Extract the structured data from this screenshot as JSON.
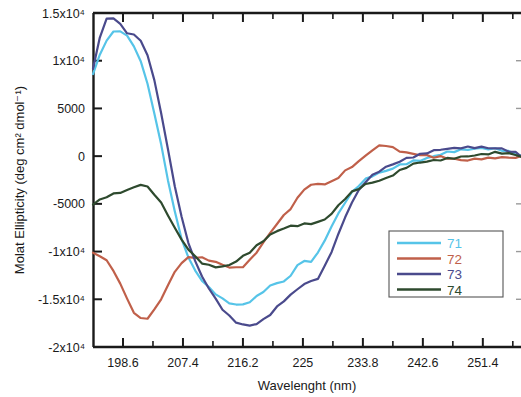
{
  "chart_data": {
    "type": "line",
    "title": "",
    "xlabel": "Wavelenght (nm)",
    "ylabel": "Molat Ellipticity (deg cm² dmol⁻¹)",
    "xlim": [
      194.2,
      257.0
    ],
    "ylim": [
      -20000,
      15000
    ],
    "grid": false,
    "legend_position": "bottom-right",
    "xticks": [
      198.6,
      207.4,
      216.2,
      225,
      233.8,
      242.6,
      251.4
    ],
    "xtick_labels": [
      "198.6",
      "207.4",
      "216.2",
      "225",
      "233.8",
      "242.6",
      "251.4"
    ],
    "yticks": [
      15000,
      10000,
      5000,
      0,
      -5000,
      -10000,
      -15000,
      -20000
    ],
    "ytick_labels": [
      "1.5x10⁴",
      "1x10⁴",
      "5000",
      "0",
      "-5000",
      "-1x10⁴",
      "-1.5x10⁴",
      "-2x10⁴"
    ],
    "x": [
      194.2,
      195.2,
      196.2,
      197.2,
      198.2,
      199.2,
      200.2,
      201.2,
      202.2,
      203.2,
      204.2,
      205.2,
      206.2,
      207.2,
      208.2,
      209.2,
      210.2,
      211.2,
      212.2,
      213.2,
      214.2,
      215.2,
      216.2,
      217.2,
      218.2,
      219.2,
      220.2,
      221.2,
      222.2,
      223.2,
      224.2,
      225.2,
      226.2,
      227.2,
      228.2,
      229.2,
      230.2,
      231.2,
      232.2,
      233.2,
      234.2,
      235.2,
      236.2,
      237.2,
      238.2,
      239.2,
      240.2,
      241.2,
      242.2,
      243.2,
      244.2,
      245.2,
      246.2,
      247.2,
      248.2,
      249.2,
      250.2,
      251.2,
      252.2,
      253.2,
      254.2,
      255.2,
      256.2,
      257.0
    ],
    "series": [
      {
        "name": "71",
        "color": "#56C4E8",
        "values": [
          8600,
          10600,
          12200,
          13000,
          13200,
          12600,
          11600,
          10000,
          7600,
          4600,
          1200,
          -2400,
          -5800,
          -8600,
          -10600,
          -12000,
          -13000,
          -13800,
          -14400,
          -15000,
          -15400,
          -15600,
          -15600,
          -15300,
          -14800,
          -14200,
          -13700,
          -13300,
          -13200,
          -12600,
          -11400,
          -11100,
          -11000,
          -10200,
          -8800,
          -7400,
          -6000,
          -4800,
          -3800,
          -3000,
          -2400,
          -2000,
          -1700,
          -1500,
          -1200,
          -900,
          -700,
          -500,
          -400,
          -200,
          0,
          200,
          400,
          500,
          600,
          700,
          700,
          800,
          700,
          700,
          600,
          400,
          200,
          0
        ]
      },
      {
        "name": "72",
        "color": "#C0604A",
        "values": [
          -10200,
          -10400,
          -11000,
          -12000,
          -13400,
          -15000,
          -16400,
          -17100,
          -17000,
          -16200,
          -15000,
          -13600,
          -12200,
          -11200,
          -10700,
          -10600,
          -10700,
          -10900,
          -11100,
          -11400,
          -11600,
          -11700,
          -11500,
          -10900,
          -10000,
          -9000,
          -8000,
          -7000,
          -6200,
          -5400,
          -4400,
          -3400,
          -3000,
          -2900,
          -2900,
          -2700,
          -2200,
          -1600,
          -1100,
          -600,
          0,
          600,
          1000,
          1100,
          800,
          500,
          300,
          200,
          100,
          0,
          -100,
          -100,
          -200,
          -300,
          -400,
          -400,
          -300,
          -200,
          -200,
          -100,
          -100,
          -100,
          -100,
          0
        ]
      },
      {
        "name": "73",
        "color": "#4A4A8C",
        "values": [
          9200,
          12400,
          14400,
          14500,
          13800,
          13000,
          12700,
          12200,
          10600,
          8000,
          4600,
          700,
          -3000,
          -6400,
          -9000,
          -11000,
          -12600,
          -13800,
          -15000,
          -16000,
          -16800,
          -17400,
          -17700,
          -17800,
          -17600,
          -17200,
          -16600,
          -15900,
          -15200,
          -14600,
          -14000,
          -13400,
          -13200,
          -12800,
          -11600,
          -10000,
          -8200,
          -6400,
          -4800,
          -3600,
          -2600,
          -2000,
          -1500,
          -1100,
          -800,
          -500,
          -200,
          0,
          200,
          400,
          600,
          700,
          800,
          800,
          900,
          900,
          900,
          900,
          800,
          800,
          700,
          500,
          300,
          0
        ]
      },
      {
        "name": "74",
        "color": "#2E4A2E",
        "values": [
          -5000,
          -4600,
          -4200,
          -4000,
          -3800,
          -3600,
          -3300,
          -3000,
          -3300,
          -4000,
          -5000,
          -6200,
          -7600,
          -8800,
          -9800,
          -10600,
          -11200,
          -11500,
          -11600,
          -11600,
          -11400,
          -11000,
          -10500,
          -10000,
          -9400,
          -8800,
          -8200,
          -7800,
          -7500,
          -7300,
          -7200,
          -7100,
          -7000,
          -6900,
          -6600,
          -6000,
          -5200,
          -4400,
          -3800,
          -3400,
          -3000,
          -2800,
          -2600,
          -2400,
          -2000,
          -1600,
          -1200,
          -900,
          -700,
          -600,
          -500,
          -400,
          -300,
          -200,
          -100,
          0,
          100,
          200,
          300,
          400,
          400,
          300,
          200,
          0
        ]
      }
    ]
  },
  "legend": {
    "entries": [
      {
        "label": "71",
        "color": "#56C4E8"
      },
      {
        "label": "72",
        "color": "#C0604A"
      },
      {
        "label": "73",
        "color": "#4A4A8C"
      },
      {
        "label": "74",
        "color": "#2E4A2E"
      }
    ]
  }
}
